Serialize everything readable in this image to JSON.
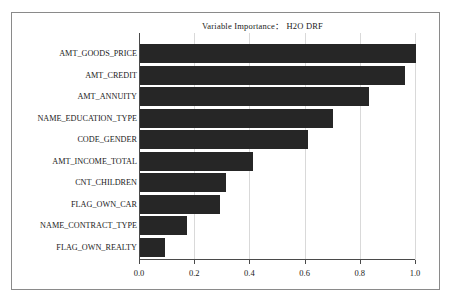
{
  "chart_data": {
    "type": "bar",
    "orientation": "horizontal",
    "title": "Variable Importance：  H2O DRF",
    "xlabel": "",
    "ylabel": "",
    "xlim": [
      0.0,
      1.0
    ],
    "grid": true,
    "legend": false,
    "bar_color": "#262626",
    "gridline_color": "#d9d9d9",
    "axis_color": "#4a4a4a",
    "frame_color": "#8a8a8a",
    "xticks": [
      "0.0",
      "0.2",
      "0.4",
      "0.6",
      "0.8",
      "1.0"
    ],
    "xtick_values": [
      0.0,
      0.2,
      0.4,
      0.6,
      0.8,
      1.0
    ],
    "categories": [
      "AMT_GOODS_PRICE",
      "AMT_CREDIT",
      "AMT_ANNUITY",
      "NAME_EDUCATION_TYPE",
      "CODE_GENDER",
      "AMT_INCOME_TOTAL",
      "CNT_CHILDREN",
      "FLAG_OWN_CAR",
      "NAME_CONTRACT_TYPE",
      "FLAG_OWN_REALTY"
    ],
    "values": [
      1.0,
      0.96,
      0.83,
      0.7,
      0.61,
      0.41,
      0.31,
      0.29,
      0.17,
      0.09
    ]
  }
}
